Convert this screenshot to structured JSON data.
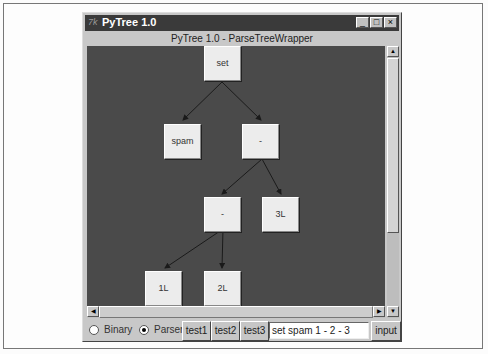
{
  "window": {
    "app_icon": "tk-icon",
    "title": "PyTree 1.0",
    "controls": {
      "minimize": "_",
      "maximize": "□",
      "close": "×"
    },
    "subtitle": "PyTree 1.0 - ParseTreeWrapper"
  },
  "tree": {
    "nodes": [
      {
        "id": "root",
        "label": "set"
      },
      {
        "id": "n1",
        "label": "spam"
      },
      {
        "id": "n2",
        "label": "-"
      },
      {
        "id": "n3",
        "label": "-"
      },
      {
        "id": "n4",
        "label": "3L"
      },
      {
        "id": "n5",
        "label": "1L"
      },
      {
        "id": "n6",
        "label": "2L"
      }
    ]
  },
  "scrollbars": {
    "up": "▲",
    "down": "▼",
    "left": "◀",
    "right": "▶"
  },
  "controls": {
    "radio_binary": {
      "label": "Binary",
      "selected": false
    },
    "radio_parser": {
      "label": "Parser",
      "selected": true
    },
    "buttons": [
      "test1",
      "test2",
      "test3"
    ],
    "input_value": "set spam 1 - 2 - 3",
    "input_button": "input"
  }
}
